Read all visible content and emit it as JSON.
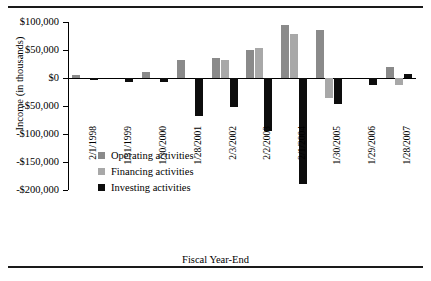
{
  "chart_data": {
    "type": "bar",
    "title": "",
    "xlabel": "Fiscal Year-End",
    "ylabel": "Income (in thousands)",
    "categories": [
      "2/1/1998",
      "1/31/1999",
      "1/30/2000",
      "1/28/2001",
      "2/3/2002",
      "2/2/2003",
      "2/1/2004",
      "1/30/2005",
      "1/29/2006",
      "1/28/2007"
    ],
    "ylim": [
      -200000,
      100000
    ],
    "yticks": [
      100000,
      50000,
      0,
      -50000,
      -100000,
      -150000,
      -200000
    ],
    "ytick_labels": [
      "$100,000",
      "$50,000",
      "$0",
      "-$50,000",
      "-$100,000",
      "-$150,000",
      "-$200,000"
    ],
    "grid": false,
    "legend_position": "inside-lower-left",
    "series": [
      {
        "name": "Operating activities",
        "color": "#8a8a8a",
        "values": [
          5000,
          0,
          10000,
          33000,
          35000,
          50000,
          95000,
          85000,
          0,
          20000
        ]
      },
      {
        "name": "Financing activities",
        "color": "#a8a8a8",
        "values": [
          0,
          0,
          0,
          0,
          32000,
          53000,
          78000,
          -35000,
          0,
          -12000
        ]
      },
      {
        "name": "Investing activities",
        "color": "#0d0d0d",
        "values": [
          -4000,
          -8000,
          -8000,
          -68000,
          -52000,
          -95000,
          -190000,
          -47000,
          -12000,
          8000
        ]
      }
    ]
  },
  "legend": {
    "items": [
      {
        "label": "Operating activities",
        "color": "#8a8a8a"
      },
      {
        "label": "Financing activities",
        "color": "#a8a8a8"
      },
      {
        "label": "Investing activities",
        "color": "#0d0d0d"
      }
    ]
  }
}
